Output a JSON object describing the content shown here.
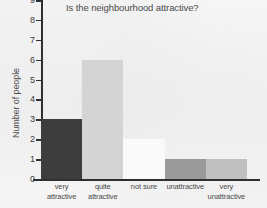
{
  "chart_data": {
    "type": "bar",
    "title": "Is the neighbourhood attractive?",
    "xlabel": "",
    "ylabel": "Number of people",
    "categories": [
      "very attractive",
      "quite attractive",
      "not sure",
      "unattractive",
      "very unattractive"
    ],
    "category_lines": [
      [
        "very",
        "attractive"
      ],
      [
        "quite",
        "attractive"
      ],
      [
        "not sure",
        ""
      ],
      [
        "unattractive",
        ""
      ],
      [
        "very",
        "unattractive"
      ]
    ],
    "values": [
      3,
      6,
      2,
      1,
      1
    ],
    "bar_colors": [
      "#3d3d3d",
      "#d4d4d4",
      "#fafafa",
      "#9a9a9a",
      "#c0c0c0"
    ],
    "ylim": [
      0,
      9
    ],
    "y_ticks": [
      0,
      1,
      2,
      3,
      4,
      5,
      6,
      7,
      8,
      9
    ],
    "y_tick_labels": [
      "0",
      "1",
      "2",
      "3",
      "4",
      "5",
      "6",
      "7",
      "8",
      "9"
    ],
    "grid": false,
    "legend": "none",
    "bar_gap": 0,
    "axis_color": "#2f2f2f",
    "background_color": "#f4f4f4",
    "text_color": "#4a4a4a"
  }
}
